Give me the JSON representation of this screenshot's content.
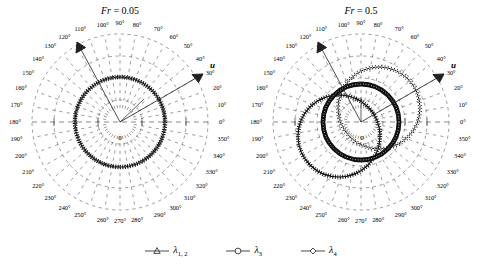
{
  "figure": {
    "angle_labels": [
      "0°",
      "10°",
      "20°",
      "30°",
      "40°",
      "50°",
      "60°",
      "70°",
      "80°",
      "90°",
      "100°",
      "110°",
      "120°",
      "130°",
      "140°",
      "150°",
      "160°",
      "170°",
      "180°",
      "190°",
      "200°",
      "210°",
      "220°",
      "230°",
      "240°",
      "250°",
      "260°",
      "270°",
      "280°",
      "290°",
      "300°",
      "310°",
      "320°",
      "330°",
      "340°",
      "350°"
    ],
    "center_label": "0",
    "flow_arrow_label": "u",
    "flow_arrow_angle": 30,
    "secondary_arrow_angle": 120,
    "grid_color": "#3a3a3a",
    "curve_color": "#101010"
  },
  "panels": [
    {
      "id": "panel-left",
      "title_prefix": "Fr",
      "title_eq": "=",
      "title_value": "0.05",
      "title_full": "Fr = 0.05"
    },
    {
      "id": "panel-right",
      "title_prefix": "Fr",
      "title_eq": "=",
      "title_value": "0.5",
      "title_full": "Fr = 0.5"
    }
  ],
  "legend": {
    "position": "bottom-center",
    "entries": [
      {
        "marker": "triangle-marker",
        "label": "λ",
        "sub": "1, 2"
      },
      {
        "marker": "circle-marker",
        "label": "λ",
        "sub": "3"
      },
      {
        "marker": "diamond-marker",
        "label": "λ",
        "sub": "4"
      }
    ]
  },
  "chart_data": {
    "type": "line",
    "coord": "polar",
    "xlabel": "direction angle (deg)",
    "ylabel": "|λ| (radial)",
    "theta_ticks": [
      0,
      10,
      20,
      30,
      40,
      50,
      60,
      70,
      80,
      90,
      100,
      110,
      120,
      130,
      140,
      150,
      160,
      170,
      180,
      190,
      200,
      210,
      220,
      230,
      240,
      250,
      260,
      270,
      280,
      290,
      300,
      310,
      320,
      330,
      340,
      350
    ],
    "radial_grid_rings": 4,
    "rlim": [
      0,
      1.0
    ],
    "grid": true,
    "legend_entries": [
      "λ1, 2",
      "λ3",
      "λ4"
    ],
    "annotations": [
      {
        "text": "u",
        "angle_deg": 30,
        "note": "flow direction arrow"
      },
      {
        "text": "",
        "angle_deg": 120,
        "note": "secondary arrow, unlabeled"
      },
      {
        "text": "0",
        "note": "origin label at plot center"
      }
    ],
    "panels": [
      {
        "title": "Fr = 0.05",
        "series": [
          {
            "name": "λ1, 2",
            "marker": "triangle",
            "shape": "circle",
            "center_r": 0.0,
            "center_theta_deg": 0,
            "radius": 0.5
          },
          {
            "name": "λ3",
            "marker": "circle",
            "shape": "circle",
            "center_r": 0.0,
            "center_theta_deg": 0,
            "radius": 0.5
          },
          {
            "name": "λ4",
            "marker": "diamond",
            "shape": "circle",
            "center_r": 0.0,
            "center_theta_deg": 0,
            "radius": 0.5
          }
        ],
        "note": "all three curves coincide on a single circle of radius ~0.50"
      },
      {
        "title": "Fr = 0.5",
        "series": [
          {
            "name": "λ1, 2",
            "marker": "triangle",
            "shape": "circle",
            "center_r": 0.2,
            "center_theta_deg": 205,
            "radius": 0.45
          },
          {
            "name": "λ3",
            "marker": "circle",
            "shape": "circle",
            "center_r": 0.22,
            "center_theta_deg": 40,
            "radius": 0.45
          },
          {
            "name": "λ4",
            "marker": "diamond",
            "shape": "circle",
            "center_r": 0.0,
            "center_theta_deg": 0,
            "radius": 0.42
          }
        ],
        "note": "three offset overlapping circles forming a lens/vesica pattern"
      }
    ]
  }
}
